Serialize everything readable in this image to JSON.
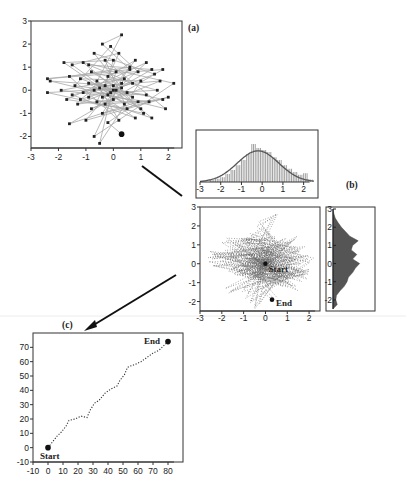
{
  "figure": {
    "panels": [
      {
        "id": "a",
        "label": "(a)"
      },
      {
        "id": "b",
        "label": "(b)"
      },
      {
        "id": "c",
        "label": "(c)"
      }
    ],
    "separator_color": "#e6e6e6",
    "line_color": "#9a9a9a",
    "dot_color": "#222222"
  },
  "chart_data": [
    {
      "panel": "(a)",
      "type": "scatter",
      "title": "",
      "xlabel": "",
      "ylabel": "",
      "xlim": [
        -3,
        2.5
      ],
      "ylim": [
        -2.5,
        3
      ],
      "xticks": [
        -3,
        -2,
        -1,
        0,
        1,
        2
      ],
      "yticks": [
        -2,
        -1,
        0,
        1,
        2,
        3
      ],
      "connected": true,
      "points": [
        [
          0.3,
          -1.9
        ],
        [
          -0.2,
          -1.4
        ],
        [
          0.9,
          -0.5
        ],
        [
          -1.6,
          -1.45
        ],
        [
          1.8,
          0.9
        ],
        [
          -2.4,
          0.5
        ],
        [
          0.6,
          0.9
        ],
        [
          -0.4,
          2.0
        ],
        [
          0.3,
          2.4
        ],
        [
          -0.9,
          -0.3
        ],
        [
          1.4,
          -1.2
        ],
        [
          -1.1,
          1.2
        ],
        [
          2.2,
          0.3
        ],
        [
          -0.7,
          -2.0
        ],
        [
          0.1,
          0.0
        ],
        [
          1.2,
          1.2
        ],
        [
          -1.7,
          -0.4
        ],
        [
          0.5,
          -0.8
        ],
        [
          -0.3,
          1.3
        ],
        [
          1.9,
          -0.8
        ],
        [
          -2.3,
          0.4
        ],
        [
          0.0,
          0.2
        ],
        [
          -0.5,
          -2.3
        ],
        [
          1.0,
          0.4
        ],
        [
          -1.2,
          0.5
        ],
        [
          0.7,
          -0.3
        ],
        [
          -0.8,
          0.8
        ],
        [
          1.6,
          0.0
        ],
        [
          -0.1,
          -0.1
        ],
        [
          -1.5,
          1.1
        ],
        [
          0.2,
          1.6
        ],
        [
          -0.6,
          -0.5
        ],
        [
          1.3,
          -0.5
        ],
        [
          -1.9,
          0.0
        ],
        [
          0.4,
          0.5
        ],
        [
          -0.4,
          -1.0
        ],
        [
          2.0,
          -0.3
        ],
        [
          -1.0,
          -1.3
        ],
        [
          0.8,
          1.3
        ],
        [
          -0.2,
          0.6
        ],
        [
          1.1,
          -1.0
        ],
        [
          -2.4,
          -0.1
        ],
        [
          0.3,
          0.1
        ],
        [
          -0.7,
          1.6
        ],
        [
          1.5,
          0.7
        ],
        [
          -1.3,
          -0.6
        ],
        [
          0.0,
          -0.4
        ],
        [
          -0.9,
          0.3
        ],
        [
          1.8,
          -0.4
        ],
        [
          -0.3,
          -0.6
        ],
        [
          0.6,
          1.0
        ],
        [
          -1.6,
          0.6
        ],
        [
          0.2,
          -1.3
        ],
        [
          -0.5,
          0.1
        ],
        [
          1.2,
          -0.2
        ],
        [
          -1.1,
          -0.1
        ],
        [
          0.9,
          0.8
        ],
        [
          -0.1,
          1.9
        ],
        [
          -1.4,
          0.2
        ],
        [
          0.5,
          -0.1
        ],
        [
          -0.8,
          -0.8
        ],
        [
          1.7,
          0.4
        ],
        [
          -0.3,
          0.2
        ],
        [
          0.0,
          1.3
        ],
        [
          -1.8,
          1.2
        ],
        [
          0.4,
          -0.6
        ],
        [
          -0.6,
          0.4
        ],
        [
          1.0,
          -0.8
        ],
        [
          -0.2,
          -0.2
        ],
        [
          0.1,
          0.8
        ],
        [
          -1.2,
          -0.4
        ],
        [
          0.7,
          0.3
        ],
        [
          -0.9,
          1.1
        ],
        [
          1.4,
          0.9
        ],
        [
          -0.4,
          -0.3
        ],
        [
          0.3,
          0.3
        ],
        [
          -1.5,
          -0.2
        ],
        [
          0.8,
          -1.2
        ],
        [
          -0.7,
          0.0
        ],
        [
          0.0,
          0.0
        ]
      ],
      "start": [
        0.0,
        0.0
      ],
      "end": [
        0.3,
        -1.9
      ]
    },
    {
      "panel": "(b) top",
      "type": "bar",
      "title": "Marginal histogram of x with fitted normal curve",
      "xlim": [
        -3,
        2.5
      ],
      "xticks": [
        -3,
        -2,
        -1,
        0,
        1,
        2
      ],
      "categories": [
        -2.5,
        -2.25,
        -2.0,
        -1.75,
        -1.5,
        -1.25,
        -1.0,
        -0.75,
        -0.5,
        -0.25,
        0.0,
        0.25,
        0.5,
        0.75,
        1.0,
        1.25,
        1.5,
        1.75,
        2.0,
        2.25
      ],
      "values": [
        0.05,
        0.08,
        0.12,
        0.2,
        0.3,
        0.42,
        0.55,
        0.7,
        0.95,
        0.85,
        0.8,
        0.75,
        0.62,
        0.55,
        0.42,
        0.33,
        0.25,
        0.18,
        0.22,
        0.06
      ],
      "fit": {
        "type": "normal",
        "mean": -0.2,
        "sd": 1.0,
        "peak": 0.78
      }
    },
    {
      "panel": "(b) main",
      "type": "scatter",
      "xlim": [
        -3,
        2.5
      ],
      "ylim": [
        -2.5,
        3
      ],
      "xticks": [
        -3,
        -2,
        -1,
        0,
        1,
        2
      ],
      "yticks": [
        -2,
        -1,
        0,
        1,
        2,
        3
      ],
      "connected": true,
      "style": "dotted",
      "annotations": [
        {
          "text": "Start",
          "x": 0.0,
          "y": 0.0
        },
        {
          "text": "End",
          "x": 0.3,
          "y": -1.9
        }
      ]
    },
    {
      "panel": "(b) right",
      "type": "bar",
      "orientation": "horizontal",
      "title": "Marginal histogram of y",
      "ylim": [
        -2.5,
        3
      ],
      "yticks": [
        -2,
        -1,
        0,
        1,
        2,
        3
      ],
      "categories": [
        -2.25,
        -2.0,
        -1.75,
        -1.5,
        -1.25,
        -1.0,
        -0.75,
        -0.5,
        -0.25,
        0.0,
        0.25,
        0.5,
        0.75,
        1.0,
        1.25,
        1.5,
        1.75,
        2.0,
        2.25,
        2.5,
        2.75
      ],
      "values": [
        0.15,
        0.1,
        0.12,
        0.25,
        0.4,
        0.5,
        0.55,
        0.7,
        0.8,
        0.95,
        0.7,
        0.85,
        0.65,
        0.7,
        0.9,
        0.6,
        0.45,
        0.3,
        0.18,
        0.08,
        0.03
      ]
    },
    {
      "panel": "(c)",
      "type": "line",
      "title": "",
      "xlabel": "",
      "ylabel": "",
      "xlim": [
        -10,
        90
      ],
      "ylim": [
        -10,
        80
      ],
      "xticks": [
        -10,
        0,
        10,
        20,
        30,
        40,
        50,
        60,
        70,
        80
      ],
      "yticks": [
        -10,
        0,
        10,
        20,
        30,
        40,
        50,
        60,
        70
      ],
      "style": "dotted",
      "x": [
        0,
        3,
        6,
        9,
        12,
        14,
        18,
        22,
        26,
        28,
        31,
        34,
        38,
        42,
        46,
        48,
        51,
        53,
        55,
        58,
        62,
        66,
        70,
        74,
        78,
        80
      ],
      "y": [
        0,
        4,
        8,
        11,
        15,
        19,
        20,
        22,
        21,
        26,
        31,
        33,
        38,
        41,
        43,
        47,
        51,
        56,
        57,
        58,
        60,
        63,
        66,
        68,
        72,
        74
      ],
      "annotations": [
        {
          "text": "Start",
          "x": 0,
          "y": 0
        },
        {
          "text": "End",
          "x": 80,
          "y": 74
        }
      ]
    }
  ]
}
